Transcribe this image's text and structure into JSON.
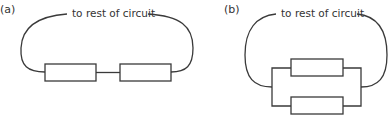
{
  "diagrams": [
    {
      "id": "a",
      "label": "(a)",
      "caption": "to rest of circuit",
      "arrangement": "series",
      "resistor_count": 2
    },
    {
      "id": "b",
      "label": "(b)",
      "caption": "to rest of circuit",
      "arrangement": "parallel",
      "resistor_count": 2
    }
  ],
  "colors": {
    "line": "#3a3a3a",
    "text": "#333333",
    "background": "#ffffff"
  }
}
